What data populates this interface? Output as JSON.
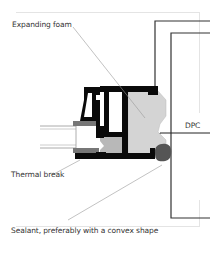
{
  "diagram": {
    "type": "window-frame-section-detail",
    "labels": {
      "expanding_foam": "Expanding foam",
      "dpc": "DPC",
      "thermal_break": "Thermal break",
      "sealant": "Sealant, preferably with a convex shape"
    },
    "colors": {
      "profile": "#0a0a0a",
      "foam": "#d4d4d4",
      "thermal_break": "#b8b8b8",
      "sealant": "#555555",
      "glazing_bead": "#777777",
      "wall_line": "#333333",
      "leader_line": "#999999",
      "border": "#e4e4e4"
    }
  }
}
